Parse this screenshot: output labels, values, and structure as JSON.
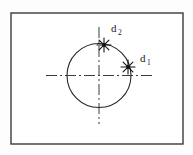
{
  "figure": {
    "background_color": "#fdfdfd",
    "frame": {
      "name": "diagram-border",
      "x": 11,
      "y": 13,
      "width": 172,
      "height": 131,
      "stroke_color": "#3a3a3a",
      "stroke_width": 1.4,
      "fill_color": "#ffffff"
    },
    "circle": {
      "name": "main-circle",
      "center_x": 99,
      "center_y": 75.5,
      "radius": 32,
      "stroke_color": "#262626",
      "stroke_width": 1.1
    },
    "center_lines": [
      {
        "name": "horizontal-center-line",
        "orientation": "horizontal",
        "x1": 46,
        "y1": 75.5,
        "x2": 152,
        "y2": 75.5,
        "style": "dash-dot",
        "stroke_color": "#3d3d3d",
        "stroke_width": 1.0
      },
      {
        "name": "vertical-center-line",
        "orientation": "vertical",
        "x1": 99,
        "y1": 27,
        "x2": 99,
        "y2": 124,
        "style": "dash-dot",
        "stroke_color": "#3d3d3d",
        "stroke_width": 1.0
      }
    ],
    "points": [
      {
        "name": "point-d2",
        "label": "d",
        "subscript": "2",
        "marker": "star-burst-icon",
        "marker_x": 104,
        "marker_y": 45,
        "marker_radius": 7,
        "label_x": 111,
        "label_y": 32,
        "color": "#111111"
      },
      {
        "name": "point-d1",
        "label": "d",
        "subscript": "1",
        "marker": "star-burst-icon",
        "marker_x": 128,
        "marker_y": 67,
        "marker_radius": 7,
        "label_x": 140,
        "label_y": 62,
        "color": "#111111"
      }
    ]
  }
}
